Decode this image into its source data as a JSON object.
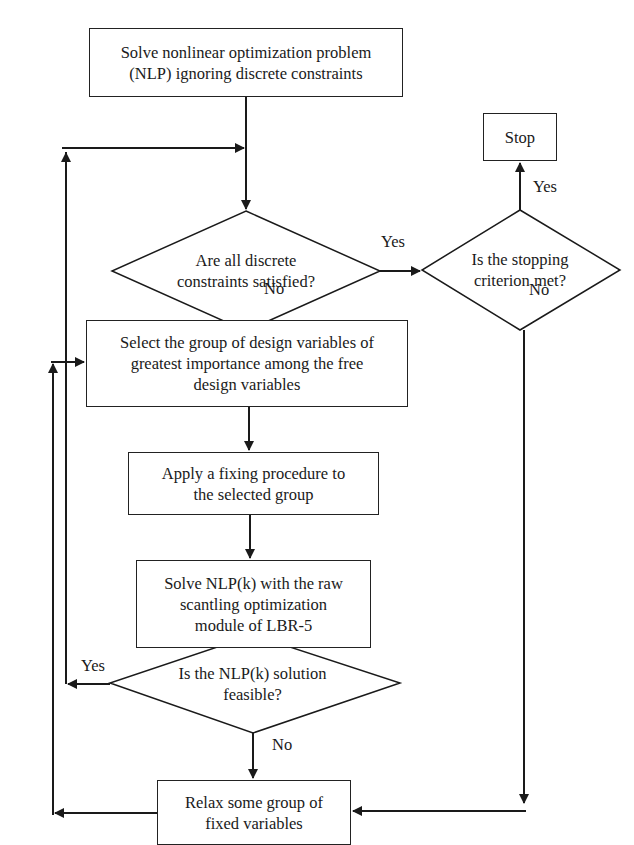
{
  "diagram": {
    "type": "flowchart",
    "nodes": {
      "start": {
        "label_line1": "Solve nonlinear optimization problem",
        "label_line2": "(NLP) ignoring discrete constraints"
      },
      "stop": {
        "label": "Stop"
      },
      "decision_discrete": {
        "label_line1": "Are all discrete",
        "label_line2": "constraints satisfied?"
      },
      "decision_stopping": {
        "label_line1": "Is the stopping",
        "label_line2": "criterion met?"
      },
      "select_group": {
        "label_line1": "Select the group of design variables of",
        "label_line2": "greatest importance among the free",
        "label_line3": "design variables"
      },
      "apply_fixing": {
        "label_line1": "Apply a fixing procedure to",
        "label_line2": "the selected group"
      },
      "solve_nlpk": {
        "label_line1": "Solve NLP(k) with the raw",
        "label_line2": "scantling optimization",
        "label_line3": "module of LBR-5"
      },
      "decision_feasible": {
        "label_line1": "Is the NLP(k) solution",
        "label_line2": "feasible?"
      },
      "relax": {
        "label_line1": "Relax some group of",
        "label_line2": "fixed variables"
      }
    },
    "edge_labels": {
      "discrete_yes": "Yes",
      "discrete_no": "No",
      "stopping_yes": "Yes",
      "stopping_no": "No",
      "feasible_yes": "Yes",
      "feasible_no": "No"
    },
    "edges": [
      {
        "from": "start",
        "to": "decision_discrete"
      },
      {
        "from": "decision_discrete",
        "to": "decision_stopping",
        "label": "Yes"
      },
      {
        "from": "decision_discrete",
        "to": "select_group",
        "label": "No"
      },
      {
        "from": "decision_stopping",
        "to": "stop",
        "label": "Yes"
      },
      {
        "from": "decision_stopping",
        "to": "relax",
        "label": "No"
      },
      {
        "from": "select_group",
        "to": "apply_fixing"
      },
      {
        "from": "apply_fixing",
        "to": "solve_nlpk"
      },
      {
        "from": "solve_nlpk",
        "to": "decision_feasible"
      },
      {
        "from": "decision_feasible",
        "to": "decision_discrete",
        "label": "Yes"
      },
      {
        "from": "decision_feasible",
        "to": "relax",
        "label": "No"
      },
      {
        "from": "relax",
        "to": "select_group"
      }
    ],
    "colors": {
      "line": "#1a1a1a",
      "background": "#ffffff"
    }
  }
}
